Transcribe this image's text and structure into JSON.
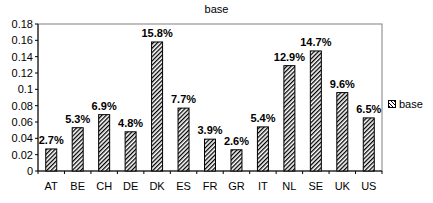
{
  "chart_data": {
    "type": "bar",
    "title": "base",
    "xlabel": "",
    "ylabel": "",
    "ylim": [
      0,
      0.18
    ],
    "yticks": [
      "0",
      "0.02",
      "0.04",
      "0.06",
      "0.08",
      "0.1",
      "0.12",
      "0.14",
      "0.16",
      "0.18"
    ],
    "categories": [
      "AT",
      "BE",
      "CH",
      "DE",
      "DK",
      "ES",
      "FR",
      "GR",
      "IT",
      "NL",
      "SE",
      "UK",
      "US"
    ],
    "series": [
      {
        "name": "base",
        "values": [
          0.027,
          0.053,
          0.069,
          0.048,
          0.158,
          0.077,
          0.039,
          0.026,
          0.054,
          0.129,
          0.147,
          0.096,
          0.065
        ],
        "labels": [
          "2.7%",
          "5.3%",
          "6.9%",
          "4.8%",
          "15.8%",
          "7.7%",
          "3.9%",
          "2.6%",
          "5.4%",
          "12.9%",
          "14.7%",
          "9.6%",
          "6.5%"
        ]
      }
    ],
    "legend": {
      "position": "right",
      "entries": [
        "base"
      ]
    },
    "grid": false
  },
  "title": "base",
  "legend_label": "base"
}
